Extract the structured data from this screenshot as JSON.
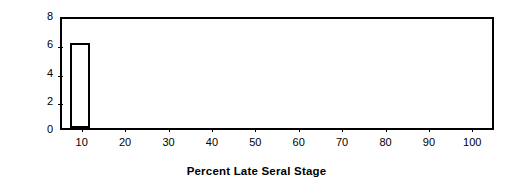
{
  "chart_data": {
    "type": "bar",
    "title": "",
    "xlabel": "Percent Late Seral Stage",
    "ylabel": "Number of WAUs",
    "categories": [
      10,
      20,
      30,
      40,
      50,
      60,
      70,
      80,
      90,
      100
    ],
    "values": [
      6,
      0,
      0,
      0,
      0,
      0,
      0,
      0,
      0,
      0
    ],
    "xtick_labels": [
      "10",
      "20",
      "30",
      "40",
      "50",
      "60",
      "70",
      "80",
      "90",
      "100"
    ],
    "ytick_labels": [
      "0",
      "2",
      "4",
      "6",
      "8"
    ],
    "ytick_values": [
      0,
      2,
      4,
      6,
      8
    ],
    "ylim": [
      0,
      8
    ],
    "xlim": [
      5,
      105
    ],
    "grid": false,
    "legend": false,
    "bar_fill_color": "#ffffff",
    "bar_edge_color": "#000000",
    "axis_color": "#000000",
    "background_color": "#ffffff"
  }
}
